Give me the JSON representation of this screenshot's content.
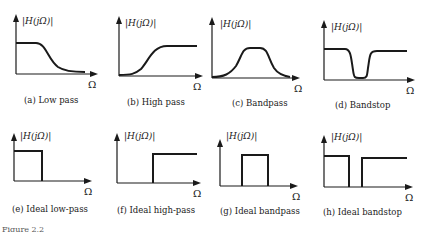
{
  "figure": {
    "axis_y_label": "|H(jΩ)|",
    "axis_x_label": "Ω",
    "stroke_color": "#1a1a1a",
    "caption_partial": "Figure 2.2"
  },
  "panels": [
    {
      "id": "a",
      "caption": "(a)  Low pass",
      "type": "lowpass"
    },
    {
      "id": "b",
      "caption": "(b)  High pass",
      "type": "highpass"
    },
    {
      "id": "c",
      "caption": "(c)  Bandpass",
      "type": "bandpass"
    },
    {
      "id": "d",
      "caption": "(d)  Bandstop",
      "type": "bandstop"
    },
    {
      "id": "e",
      "caption": "(e)  Ideal low-pass",
      "type": "ideal-lowpass"
    },
    {
      "id": "f",
      "caption": "(f)  Ideal high-pass",
      "type": "ideal-highpass"
    },
    {
      "id": "g",
      "caption": "(g)  Ideal bandpass",
      "type": "ideal-bandpass"
    },
    {
      "id": "h",
      "caption": "(h)  Ideal bandstop",
      "type": "ideal-bandstop"
    }
  ]
}
